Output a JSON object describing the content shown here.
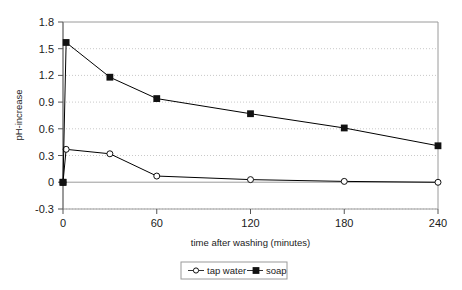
{
  "chart_data": {
    "type": "line",
    "title": "",
    "xlabel": "time after washing (minutes)",
    "ylabel": "pH-increase",
    "xlim": [
      0,
      240
    ],
    "ylim": [
      -0.3,
      1.8
    ],
    "xticks": [
      0,
      60,
      120,
      180,
      240
    ],
    "xtick_labels": [
      "0",
      "60",
      "120",
      "180",
      "240"
    ],
    "yticks": [
      -0.3,
      0,
      0.3,
      0.6,
      0.9,
      1.2,
      1.5,
      1.8
    ],
    "ytick_labels": [
      "-0.3",
      "0",
      "0.3",
      "0.6",
      "0.9",
      "1.2",
      "1.5",
      "1.8"
    ],
    "grid": "horizontal-dotted",
    "legend_position": "bottom",
    "series": [
      {
        "name": "tap water",
        "marker": "open-circle",
        "color": "#000000",
        "x": [
          0,
          2,
          30,
          60,
          120,
          180,
          240
        ],
        "y": [
          0.0,
          0.37,
          0.32,
          0.07,
          0.03,
          0.01,
          0.0
        ]
      },
      {
        "name": "soap",
        "marker": "filled-square",
        "color": "#000000",
        "x": [
          0,
          2,
          30,
          60,
          120,
          180,
          240
        ],
        "y": [
          0.0,
          1.57,
          1.18,
          0.94,
          0.77,
          0.61,
          0.41
        ]
      }
    ]
  },
  "legend": {
    "items": [
      {
        "label": "tap water",
        "marker": "open-circle"
      },
      {
        "label": "soap",
        "marker": "filled-square"
      }
    ]
  },
  "axes": {
    "y_title": "pH-increase",
    "x_title": "time after washing (minutes)"
  }
}
